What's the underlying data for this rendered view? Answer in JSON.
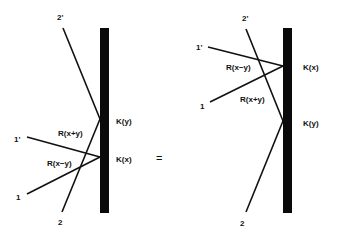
{
  "diagram": {
    "equals_sign": "=",
    "left": {
      "wall": {
        "x": 100,
        "y": 28,
        "width": 9,
        "height": 185
      },
      "vertices": [
        {
          "id": "Ky",
          "label": "K(y)",
          "x": 100,
          "y": 119,
          "label_x": 116,
          "label_y": 124
        },
        {
          "id": "Kx",
          "label": "K(x)",
          "x": 100,
          "y": 157,
          "label_x": 116,
          "label_y": 162
        }
      ],
      "lines": [
        {
          "id": "2prime",
          "x1": 63,
          "y1": 28,
          "x2": 100,
          "y2": 119
        },
        {
          "id": "2",
          "x1": 62,
          "y1": 212,
          "x2": 100,
          "y2": 119
        },
        {
          "id": "1prime",
          "x1": 27,
          "y1": 137,
          "x2": 100,
          "y2": 157
        },
        {
          "id": "1",
          "x1": 27,
          "y1": 194,
          "x2": 100,
          "y2": 157
        }
      ],
      "endpoint_labels": [
        {
          "text": "2'",
          "x": 57,
          "y": 20
        },
        {
          "text": "2",
          "x": 58,
          "y": 225
        },
        {
          "text": "1'",
          "x": 14,
          "y": 142
        },
        {
          "text": "1",
          "x": 16,
          "y": 200
        }
      ],
      "r_labels": [
        {
          "text": "R(x+y)",
          "x": 58,
          "y": 136
        },
        {
          "text": "R(x−y)",
          "x": 47,
          "y": 166
        }
      ]
    },
    "equals": {
      "x": 156,
      "y": 162
    },
    "right": {
      "wall": {
        "x": 283,
        "y": 28,
        "width": 9,
        "height": 185
      },
      "vertices": [
        {
          "id": "Kx",
          "label": "K(x)",
          "x": 283,
          "y": 66,
          "label_x": 303,
          "label_y": 70
        },
        {
          "id": "Ky",
          "label": "K(y)",
          "x": 283,
          "y": 121,
          "label_x": 303,
          "label_y": 126
        }
      ],
      "lines": [
        {
          "id": "2prime",
          "x1": 246,
          "y1": 29,
          "x2": 283,
          "y2": 121
        },
        {
          "id": "2",
          "x1": 246,
          "y1": 212,
          "x2": 283,
          "y2": 121
        },
        {
          "id": "1prime",
          "x1": 208,
          "y1": 47,
          "x2": 283,
          "y2": 66
        },
        {
          "id": "1",
          "x1": 210,
          "y1": 102,
          "x2": 283,
          "y2": 66
        }
      ],
      "endpoint_labels": [
        {
          "text": "2'",
          "x": 242,
          "y": 21
        },
        {
          "text": "2",
          "x": 240,
          "y": 226
        },
        {
          "text": "1'",
          "x": 196,
          "y": 50
        },
        {
          "text": "1",
          "x": 200,
          "y": 109
        }
      ],
      "r_labels": [
        {
          "text": "R(x−y)",
          "x": 226,
          "y": 70
        },
        {
          "text": "R(x+y)",
          "x": 240,
          "y": 102
        }
      ]
    }
  }
}
